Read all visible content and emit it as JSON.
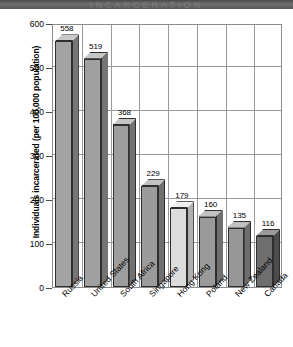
{
  "header": {
    "band_text": "INCARCERATION"
  },
  "chart_data": {
    "type": "bar",
    "title": "",
    "xlabel": "",
    "ylabel": "Individuals incarcerated (per 100,000 population)",
    "categories": [
      "Russia",
      "United States",
      "South Africa",
      "Singapore",
      "Hong Kong",
      "Poland",
      "New Zealand",
      "Canada"
    ],
    "values": [
      558,
      519,
      368,
      229,
      179,
      160,
      135,
      116
    ],
    "value_labels": [
      "558",
      "519",
      "368",
      "229",
      "179",
      "160",
      "135",
      "116"
    ],
    "ylim": [
      0,
      600
    ],
    "yticks": [
      0,
      100,
      200,
      300,
      400,
      500,
      600
    ],
    "ytick_labels": [
      "0",
      "100",
      "200",
      "300",
      "400",
      "500",
      "600"
    ],
    "grid": true,
    "legend": "none",
    "style": "3d-bar",
    "bar_colors": [
      "#a3a3a3",
      "#a0a0a0",
      "#9d9d9d",
      "#9b9b9b",
      "#dcdcdc",
      "#9a9a9a",
      "#979797",
      "#6e6e6e"
    ],
    "bar_top_colors": [
      "#c9c9c9",
      "#c6c6c6",
      "#c4c4c4",
      "#c2c2c2",
      "#efefef",
      "#c1c1c1",
      "#bfbfbf",
      "#9a9a9a"
    ],
    "bar_side_colors": [
      "#767676",
      "#747474",
      "#727272",
      "#707070",
      "#b0b0b0",
      "#6f6f6f",
      "#6d6d6d",
      "#4c4c4c"
    ],
    "highlight_category": "Hong Kong",
    "accent_color": "#dcdcdc"
  }
}
